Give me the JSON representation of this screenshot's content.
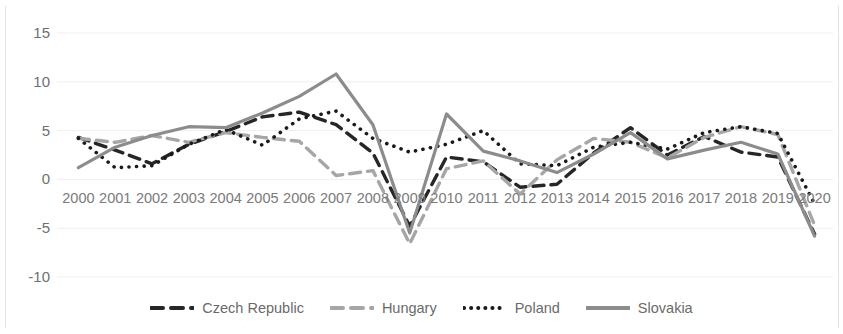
{
  "chart_data": {
    "type": "line",
    "title": "",
    "subtitle": "",
    "xlabel": "",
    "ylabel": "",
    "grid": true,
    "legend_position": "bottom",
    "ylim": [
      -10,
      15
    ],
    "yticks": [
      15,
      10,
      5,
      0,
      -5,
      -10
    ],
    "ytick_labels": [
      "15",
      "10",
      "5",
      "0",
      "-5",
      "-10"
    ],
    "categories": [
      "2000",
      "2001",
      "2002",
      "2003",
      "2004",
      "2005",
      "2006",
      "2007",
      "2008",
      "2009",
      "2010",
      "2011",
      "2012",
      "2013",
      "2014",
      "2015",
      "2016",
      "2017",
      "2018",
      "2019",
      "2020"
    ],
    "series": [
      {
        "name": "Czech Republic",
        "color": "#262626",
        "style": "dashed",
        "values": [
          4.3,
          3.0,
          1.6,
          3.6,
          4.9,
          6.4,
          6.9,
          5.6,
          2.7,
          -4.8,
          2.3,
          1.8,
          -0.8,
          -0.5,
          2.7,
          5.3,
          2.5,
          4.4,
          2.8,
          2.3,
          -5.6
        ]
      },
      {
        "name": "Hungary",
        "color": "#a6a6a6",
        "style": "dashed",
        "values": [
          4.2,
          3.8,
          4.5,
          3.8,
          4.8,
          4.3,
          3.9,
          0.4,
          0.9,
          -6.6,
          1.1,
          1.9,
          -1.5,
          2.0,
          4.2,
          3.8,
          2.2,
          4.3,
          5.4,
          4.6,
          -4.7
        ]
      },
      {
        "name": "Poland",
        "color": "#1a1a1a",
        "style": "dotted",
        "values": [
          4.2,
          1.2,
          1.4,
          3.6,
          5.1,
          3.5,
          6.2,
          7.0,
          4.2,
          2.8,
          3.6,
          5.0,
          1.6,
          1.4,
          3.3,
          3.8,
          3.1,
          4.8,
          5.4,
          4.7,
          -2.5
        ]
      },
      {
        "name": "Slovakia",
        "color": "#8c8c8c",
        "style": "solid",
        "values": [
          1.2,
          3.3,
          4.5,
          5.4,
          5.3,
          6.8,
          8.5,
          10.8,
          5.6,
          -5.5,
          6.7,
          2.9,
          1.9,
          0.7,
          2.6,
          4.8,
          2.1,
          3.0,
          3.8,
          2.6,
          -5.8
        ]
      }
    ]
  },
  "legend": {
    "items": [
      {
        "label": "Czech Republic",
        "icon": "dashed-line-swatch"
      },
      {
        "label": "Hungary",
        "icon": "dashed-line-swatch"
      },
      {
        "label": "Poland",
        "icon": "dotted-line-swatch"
      },
      {
        "label": "Slovakia",
        "icon": "solid-line-swatch"
      }
    ]
  }
}
